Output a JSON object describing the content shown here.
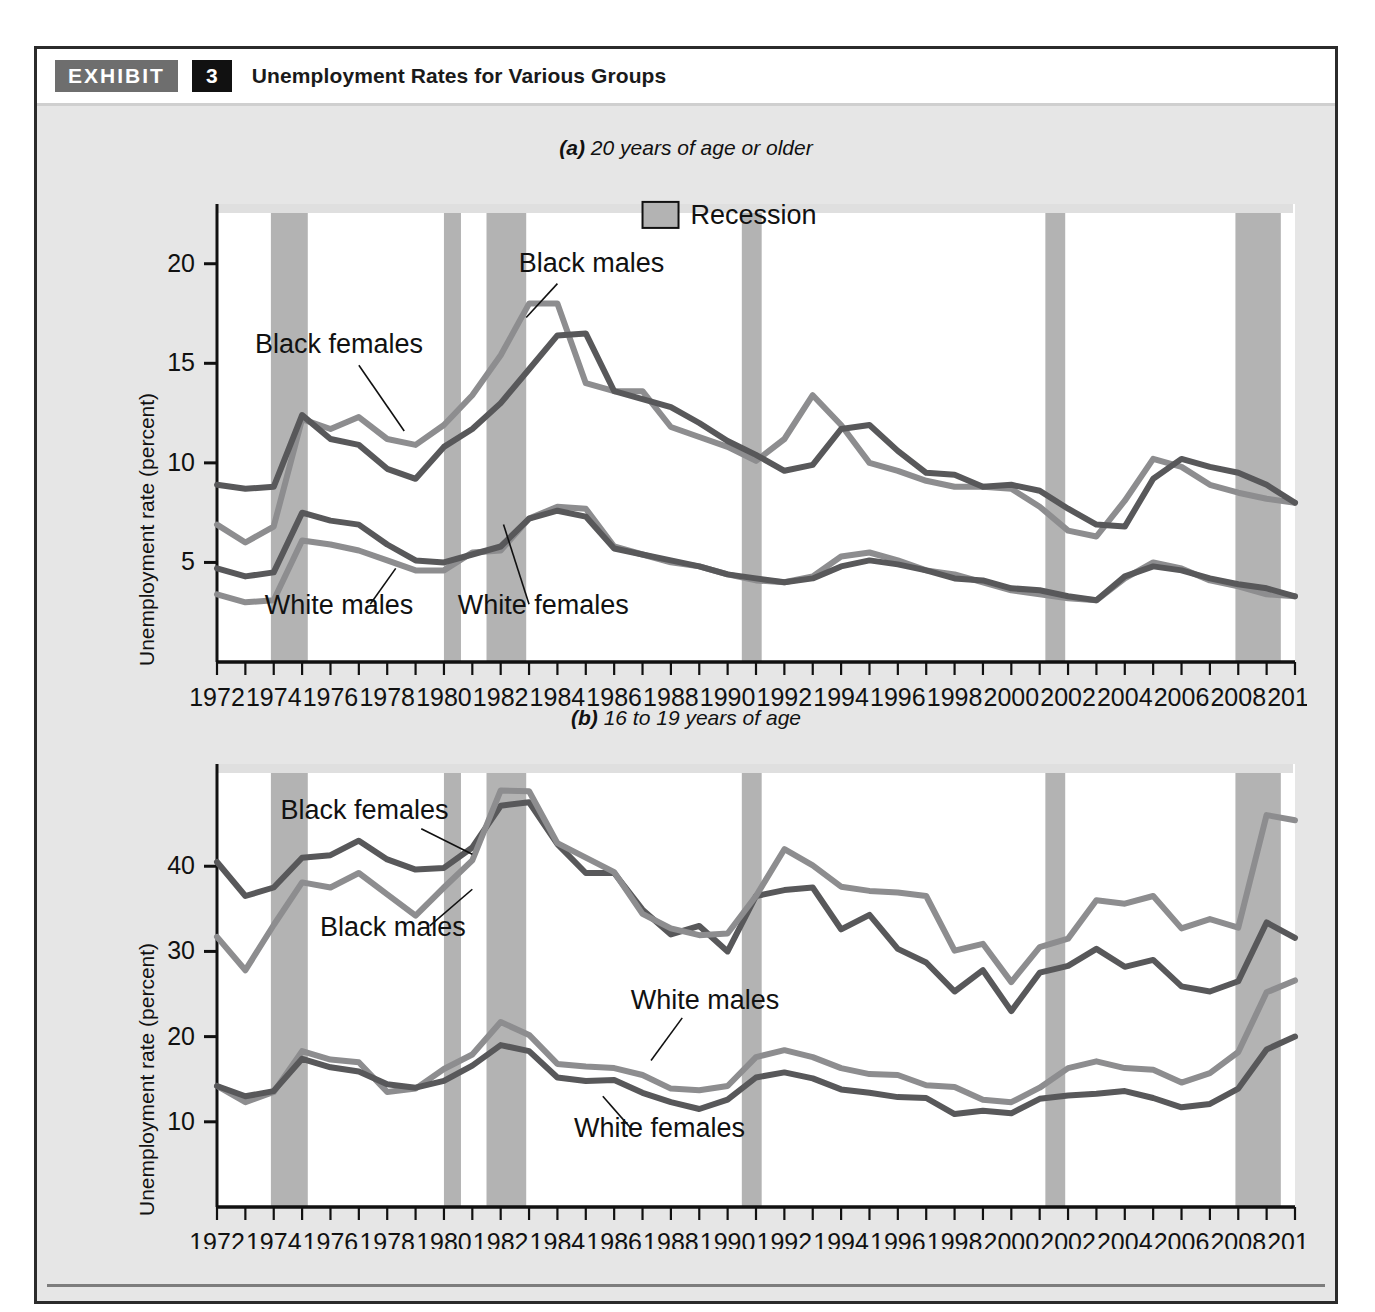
{
  "exhibit": {
    "label": "EXHIBIT",
    "number": "3",
    "title": "Unemployment Rates for Various Groups"
  },
  "legend": {
    "recession_label": "Recession",
    "recession_color": "#b3b3b3"
  },
  "colors": {
    "dark_line": "#58585a",
    "light_line": "#8d8d8f",
    "recession_band": "#b3b3b3",
    "plot_background": "#ffffff",
    "panel_background": "#e6e6e6",
    "axis": "#111111"
  },
  "caption": {
    "text": ""
  },
  "panel_a": {
    "subtitle_lead": "(a)",
    "subtitle_rest": " 20 years of age or older",
    "ylabel": "Unemployment rate (percent)",
    "series_labels": {
      "black_males": "Black males",
      "black_females": "Black females",
      "white_males": "White males",
      "white_females": "White females"
    }
  },
  "panel_b": {
    "subtitle_lead": "(b)",
    "subtitle_rest": " 16 to 19 years of age",
    "ylabel": "Unemployment rate (percent)",
    "series_labels": {
      "black_males": "Black males",
      "black_females": "Black females",
      "white_males": "White males",
      "white_females": "White females"
    }
  },
  "chart_data": [
    {
      "type": "line",
      "id": "panel-a",
      "title": "(a) 20 years of age or older",
      "xlabel": "",
      "ylabel": "Unemployment rate (percent)",
      "xlim": [
        1972,
        2010
      ],
      "ylim": [
        0,
        23
      ],
      "yticks": [
        5,
        10,
        15,
        20
      ],
      "ytick_labels": [
        "5",
        "10",
        "15",
        "20"
      ],
      "xticks": [
        1972,
        1973,
        1974,
        1975,
        1976,
        1977,
        1978,
        1979,
        1980,
        1981,
        1982,
        1983,
        1984,
        1985,
        1986,
        1987,
        1988,
        1989,
        1990,
        1991,
        1992,
        1993,
        1994,
        1995,
        1996,
        1997,
        1998,
        1999,
        2000,
        2001,
        2002,
        2003,
        2004,
        2005,
        2006,
        2007,
        2008,
        2009,
        2010
      ],
      "xtick_labels_shown": [
        "1972",
        "1974",
        "1976",
        "1978",
        "1980",
        "1982",
        "1984",
        "1986",
        "1988",
        "1990",
        "1992",
        "1994",
        "1996",
        "1998",
        "2000",
        "2002",
        "2004",
        "2006",
        "2008",
        "2010"
      ],
      "grid": false,
      "legend_position": "top-center",
      "x": [
        1972,
        1973,
        1974,
        1975,
        1976,
        1977,
        1978,
        1979,
        1980,
        1981,
        1982,
        1983,
        1984,
        1985,
        1986,
        1987,
        1988,
        1989,
        1990,
        1991,
        1992,
        1993,
        1994,
        1995,
        1996,
        1997,
        1998,
        1999,
        2000,
        2001,
        2002,
        2003,
        2004,
        2005,
        2006,
        2007,
        2008,
        2009,
        2010
      ],
      "series": [
        {
          "name": "Black females",
          "color": "#8d8d8f",
          "values": [
            6.9,
            6.0,
            6.8,
            12.2,
            11.7,
            12.3,
            11.2,
            10.9,
            11.9,
            13.4,
            15.4,
            18.0,
            18.0,
            14.0,
            13.6,
            13.6,
            11.8,
            11.3,
            10.8,
            10.1,
            11.2,
            13.4,
            11.9,
            10.0,
            9.6,
            9.1,
            8.8,
            8.8,
            8.7,
            7.8,
            6.6,
            6.3,
            8.1,
            10.2,
            9.8,
            8.9,
            8.5,
            8.2,
            8.0,
            9.0,
            16.0,
            17.9,
            17.9
          ],
          "values_note": "series read from plot; last point at 2010"
        },
        {
          "name": "Black males",
          "color": "#58585a",
          "values": [
            8.9,
            8.7,
            8.8,
            12.4,
            11.2,
            10.9,
            9.7,
            9.2,
            10.8,
            11.7,
            13.0,
            14.7,
            16.4,
            16.5,
            13.6,
            13.2,
            12.8,
            12.0,
            11.1,
            10.4,
            9.6,
            9.9,
            11.7,
            11.9,
            10.6,
            9.5,
            9.4,
            8.8,
            8.9,
            8.6,
            7.7,
            6.9,
            6.8,
            9.2,
            10.2,
            9.8,
            9.5,
            8.9,
            8.0,
            7.9,
            8.5,
            12.0,
            13.8
          ]
        },
        {
          "name": "White males",
          "color": "#8d8d8f",
          "values": [
            3.4,
            3.0,
            3.1,
            6.1,
            5.9,
            5.6,
            5.1,
            4.6,
            4.6,
            5.5,
            5.6,
            7.2,
            7.8,
            7.7,
            5.8,
            5.4,
            5.0,
            4.8,
            4.4,
            4.1,
            4.0,
            4.3,
            5.3,
            5.5,
            5.1,
            4.6,
            4.4,
            4.0,
            3.6,
            3.4,
            3.2,
            3.1,
            4.2,
            5.0,
            4.7,
            4.1,
            3.8,
            3.4,
            3.3,
            3.4,
            4.5,
            8.5,
            9.2
          ]
        },
        {
          "name": "White females",
          "color": "#58585a",
          "values": [
            4.7,
            4.3,
            4.5,
            7.5,
            7.1,
            6.9,
            5.9,
            5.1,
            5.0,
            5.4,
            5.8,
            7.2,
            7.6,
            7.3,
            5.7,
            5.4,
            5.1,
            4.8,
            4.4,
            4.2,
            4.0,
            4.2,
            4.8,
            5.1,
            4.9,
            4.6,
            4.2,
            4.1,
            3.7,
            3.6,
            3.3,
            3.1,
            4.3,
            4.8,
            4.6,
            4.2,
            3.9,
            3.7,
            3.3,
            3.5,
            4.4,
            6.6,
            7.3
          ]
        }
      ],
      "annotations": [
        {
          "text": "Black males",
          "x": 1982.5,
          "y": 19.2
        },
        {
          "text": "Black females",
          "x": 1976.5,
          "y": 15.6
        },
        {
          "text": "White males",
          "x": 1975.5,
          "y": 2.6
        },
        {
          "text": "White females",
          "x": 1983.0,
          "y": 2.6
        },
        {
          "text": "Recession",
          "x": 1988.0,
          "y": 22.4
        }
      ],
      "recessions": [
        {
          "start": 1973.9,
          "end": 1975.2
        },
        {
          "start": 1980.0,
          "end": 1980.6
        },
        {
          "start": 1981.5,
          "end": 1982.9
        },
        {
          "start": 1990.5,
          "end": 1991.2
        },
        {
          "start": 2001.2,
          "end": 2001.9
        },
        {
          "start": 2007.9,
          "end": 2009.5
        }
      ]
    },
    {
      "type": "line",
      "id": "panel-b",
      "title": "(b) 16 to 19 years of age",
      "xlabel": "",
      "ylabel": "Unemployment rate (percent)",
      "xlim": [
        1972,
        2010
      ],
      "ylim": [
        0,
        52
      ],
      "yticks": [
        10,
        20,
        30,
        40
      ],
      "ytick_labels": [
        "10",
        "20",
        "30",
        "40"
      ],
      "xticks": [
        1972,
        1973,
        1974,
        1975,
        1976,
        1977,
        1978,
        1979,
        1980,
        1981,
        1982,
        1983,
        1984,
        1985,
        1986,
        1987,
        1988,
        1989,
        1990,
        1991,
        1992,
        1993,
        1994,
        1995,
        1996,
        1997,
        1998,
        1999,
        2000,
        2001,
        2002,
        2003,
        2004,
        2005,
        2006,
        2007,
        2008,
        2009,
        2010
      ],
      "xtick_labels_shown": [
        "1972",
        "1974",
        "1976",
        "1978",
        "1980",
        "1982",
        "1984",
        "1986",
        "1988",
        "1990",
        "1992",
        "1994",
        "1996",
        "1998",
        "2000",
        "2002",
        "2004",
        "2006",
        "2008",
        "2010"
      ],
      "grid": false,
      "legend_position": "none",
      "x": [
        1972,
        1973,
        1974,
        1975,
        1976,
        1977,
        1978,
        1979,
        1980,
        1981,
        1982,
        1983,
        1984,
        1985,
        1986,
        1987,
        1988,
        1989,
        1990,
        1991,
        1992,
        1993,
        1994,
        1995,
        1996,
        1997,
        1998,
        1999,
        2000,
        2001,
        2002,
        2003,
        2004,
        2005,
        2006,
        2007,
        2008,
        2009,
        2010
      ],
      "series": [
        {
          "name": "Black females",
          "color": "#58585a",
          "values": [
            40.5,
            36.5,
            37.5,
            41.0,
            41.3,
            43.0,
            40.8,
            39.6,
            39.8,
            42.2,
            47.1,
            47.5,
            42.6,
            39.2,
            39.2,
            34.9,
            32.0,
            33.0,
            30.0,
            36.5,
            37.2,
            37.5,
            32.6,
            34.3,
            30.3,
            28.7,
            25.3,
            27.8,
            23.0,
            27.5,
            28.3,
            30.3,
            28.2,
            29.0,
            25.9,
            25.3,
            26.5,
            33.4,
            31.6
          ]
        },
        {
          "name": "Black males",
          "color": "#8d8d8f",
          "values": [
            31.7,
            27.8,
            33.1,
            38.1,
            37.5,
            39.2,
            36.7,
            34.2,
            37.5,
            40.7,
            48.9,
            48.8,
            42.7,
            41.0,
            39.3,
            34.4,
            32.7,
            31.9,
            32.1,
            36.5,
            42.0,
            40.1,
            37.6,
            37.1,
            36.9,
            36.5,
            30.1,
            30.9,
            26.4,
            30.5,
            31.5,
            36.0,
            35.6,
            36.5,
            32.7,
            33.8,
            32.8,
            46.0,
            45.4,
            43.0
          ]
        },
        {
          "name": "White males",
          "color": "#8d8d8f",
          "values": [
            14.2,
            12.3,
            13.5,
            18.3,
            17.3,
            17.0,
            13.5,
            13.9,
            16.2,
            17.9,
            21.7,
            20.2,
            16.8,
            16.5,
            16.3,
            15.5,
            13.9,
            13.7,
            14.2,
            17.6,
            18.4,
            17.6,
            16.3,
            15.6,
            15.5,
            14.3,
            14.1,
            12.6,
            12.3,
            14.0,
            16.3,
            17.1,
            16.3,
            16.1,
            14.6,
            15.7,
            18.2,
            25.2,
            26.6
          ]
        },
        {
          "name": "White females",
          "color": "#58585a",
          "values": [
            14.2,
            13.0,
            13.6,
            17.4,
            16.4,
            15.9,
            14.4,
            14.0,
            14.8,
            16.6,
            19.0,
            18.3,
            15.2,
            14.8,
            14.9,
            13.4,
            12.3,
            11.5,
            12.6,
            15.2,
            15.8,
            15.1,
            13.8,
            13.4,
            12.9,
            12.8,
            10.9,
            11.3,
            11.0,
            12.7,
            13.1,
            13.3,
            13.6,
            12.8,
            11.7,
            12.1,
            13.9,
            18.5,
            20.0
          ]
        }
      ],
      "annotations": [
        {
          "text": "Black females",
          "x": 1977.0,
          "y": 45.5
        },
        {
          "text": "Black males",
          "x": 1977.5,
          "y": 32.0
        },
        {
          "text": "White males",
          "x": 1988.5,
          "y": 23.0
        },
        {
          "text": "White females",
          "x": 1987.5,
          "y": 8.5
        }
      ],
      "recessions": [
        {
          "start": 1973.9,
          "end": 1975.2
        },
        {
          "start": 1980.0,
          "end": 1980.6
        },
        {
          "start": 1981.5,
          "end": 1982.9
        },
        {
          "start": 1990.5,
          "end": 1991.2
        },
        {
          "start": 2001.2,
          "end": 2001.9
        },
        {
          "start": 2007.9,
          "end": 2009.5
        }
      ]
    }
  ]
}
